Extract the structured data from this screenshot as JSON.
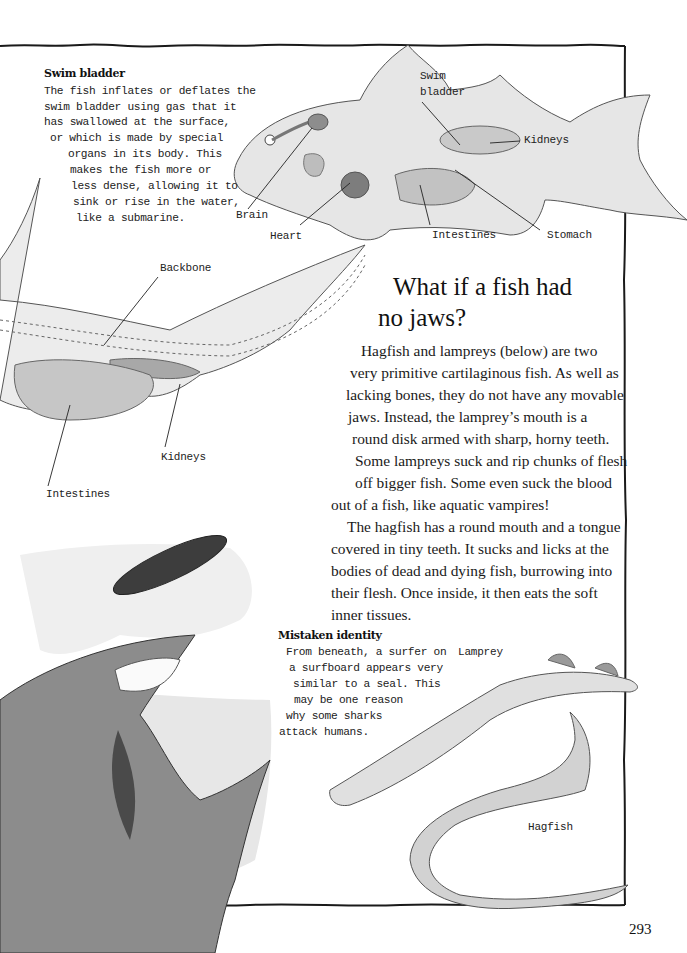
{
  "page": {
    "number": "293",
    "colors": {
      "ink": "#1a1a1a",
      "wash_light": "#e4e4e4",
      "wash_mid": "#c4c4c4",
      "wash_dark": "#6a6a6a",
      "background": "#ffffff"
    }
  },
  "swim_bladder_box": {
    "title": "Swim bladder",
    "lines": [
      "The fish inflates or deflates the",
      "swim bladder using gas that it",
      "has swallowed at the surface,",
      "or which is made by special",
      "organs in its body. This",
      "makes the fish more or",
      "less dense, allowing it to",
      "sink or rise in the water,",
      "like a submarine."
    ]
  },
  "bony_fish_diagram": {
    "labels": {
      "swim_bladder_1": "Swim",
      "swim_bladder_2": "bladder",
      "kidneys": "Kidneys",
      "brain": "Brain",
      "heart": "Heart",
      "intestines": "Intestines",
      "stomach": "Stomach"
    }
  },
  "shark_diagram": {
    "labels": {
      "backbone": "Backbone",
      "kidneys": "Kidneys",
      "intestines": "Intestines"
    }
  },
  "article": {
    "heading_line1": "What if a fish had",
    "heading_line2": "no jaws?",
    "paragraph1": [
      "Hagfish and lampreys (below) are two",
      "very primitive cartilaginous fish. As well as",
      "lacking bones, they do not have any movable",
      "jaws. Instead, the lamprey’s mouth is a",
      "round disk armed with sharp, horny teeth.",
      "Some lampreys suck and rip chunks of flesh",
      "off bigger fish. Some even suck the blood",
      "out of a fish, like aquatic vampires!"
    ],
    "paragraph2": [
      "The hagfish has a round mouth and a tongue",
      "covered in tiny teeth. It sucks and licks at the",
      "bodies of dead and dying fish, burrowing into",
      "their flesh. Once inside, it then eats the soft",
      "inner tissues."
    ]
  },
  "mistaken_identity_box": {
    "title": "Mistaken identity",
    "lines": [
      "From beneath, a surfer on",
      "a surfboard appears very",
      "similar to a seal. This",
      "may be one reason",
      "why some sharks",
      "attack humans."
    ]
  },
  "jawless_fish_illustration": {
    "labels": {
      "lamprey": "Lamprey",
      "hagfish": "Hagfish"
    }
  }
}
